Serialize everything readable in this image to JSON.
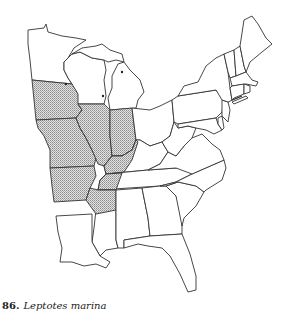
{
  "figure": {
    "number": "86.",
    "species": "Leptotes marina",
    "map_region": "Eastern United States",
    "legend": {
      "shaded": "range area (stippled)",
      "dots": "isolated records"
    }
  },
  "map": {
    "shaded_states": [
      "Iowa",
      "Missouri",
      "Illinois",
      "Indiana",
      "Arkansas",
      "Western Kentucky",
      "Western Tennessee",
      "Southern Minnesota edge"
    ],
    "unshaded_states": [
      "Minnesota",
      "Wisconsin",
      "Michigan",
      "Ohio",
      "Pennsylvania",
      "New York",
      "Vermont",
      "New Hampshire",
      "Maine",
      "Massachusetts",
      "Connecticut",
      "Rhode Island",
      "New Jersey",
      "Delaware",
      "Maryland",
      "West Virginia",
      "Virginia",
      "Kentucky",
      "Tennessee",
      "North Carolina",
      "South Carolina",
      "Georgia",
      "Florida",
      "Alabama",
      "Mississippi",
      "Louisiana"
    ],
    "colors": {
      "outline": "#333333",
      "stipple": "#9a9a9a",
      "background": "#ffffff"
    }
  }
}
